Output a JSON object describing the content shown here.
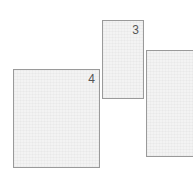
{
  "diagram": {
    "panels": [
      {
        "id": "panel-3",
        "label": "3"
      },
      {
        "id": "panel-4",
        "label": "4"
      },
      {
        "id": "panel-right",
        "label": ""
      }
    ],
    "colors": {
      "border": "#9a9a9a",
      "fill": "#f3f3f3",
      "label": "#555555"
    }
  }
}
